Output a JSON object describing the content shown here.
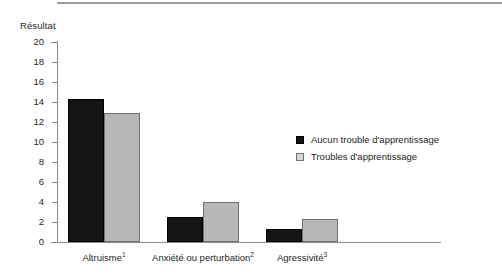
{
  "chart_data": {
    "type": "bar",
    "title": "",
    "subtitle": "",
    "ylabel": "Résultat",
    "xlabel": "",
    "ylim": [
      0,
      20
    ],
    "yticks": [
      20,
      18,
      16,
      14,
      12,
      10,
      8,
      6,
      4,
      2,
      0
    ],
    "grid": false,
    "legend_position": "right-middle",
    "categories": [
      "Altruisme¹",
      "Anxiété ou perturbation²",
      "Agressivité³"
    ],
    "series": [
      {
        "name": "Aucun trouble d'apprentissage",
        "color": "#151515",
        "values": [
          14.3,
          2.5,
          1.3
        ]
      },
      {
        "name": "Troubles d'apprentissage",
        "color": "#b8b8b8",
        "values": [
          12.9,
          4.0,
          2.3
        ]
      }
    ]
  },
  "axis": {
    "title": "Résultat",
    "ticks": [
      {
        "label": "20"
      },
      {
        "label": "18"
      },
      {
        "label": "16"
      },
      {
        "label": "14"
      },
      {
        "label": "12"
      },
      {
        "label": "10"
      },
      {
        "label": "8"
      },
      {
        "label": "6"
      },
      {
        "label": "4"
      },
      {
        "label": "2"
      },
      {
        "label": "0"
      }
    ]
  },
  "categories": [
    {
      "base": "Altruisme",
      "note": "1"
    },
    {
      "base": "Anxiété ou perturbation",
      "note": "2"
    },
    {
      "base": "Agressivité",
      "note": "3"
    }
  ],
  "legend": {
    "items": [
      {
        "label": "Aucun trouble d'apprentissage",
        "swatch": "dark"
      },
      {
        "label": "Troubles d'apprentissage",
        "swatch": "light"
      }
    ]
  }
}
